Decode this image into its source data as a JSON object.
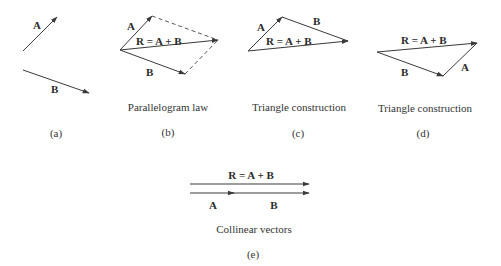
{
  "figure": {
    "colors": {
      "vector": "#3a3a3a",
      "dashed": "#555555",
      "text": "#2b2b2b",
      "background": "#ffffff"
    },
    "panels": [
      {
        "id": "a",
        "sublabel": "(a)",
        "caption": "",
        "vectors": [
          {
            "name": "A",
            "label": "A"
          },
          {
            "name": "B",
            "label": "B"
          }
        ]
      },
      {
        "id": "b",
        "sublabel": "(b)",
        "caption": "Parallelogram law",
        "vectors": [
          {
            "name": "A",
            "label": "A"
          },
          {
            "name": "B",
            "label": "B"
          },
          {
            "name": "R",
            "label": "R = A + B"
          }
        ]
      },
      {
        "id": "c",
        "sublabel": "(c)",
        "caption": "Triangle construction",
        "vectors": [
          {
            "name": "A",
            "label": "A"
          },
          {
            "name": "B",
            "label": "B"
          },
          {
            "name": "R",
            "label": "R = A + B"
          }
        ]
      },
      {
        "id": "d",
        "sublabel": "(d)",
        "caption": "Triangle construction",
        "vectors": [
          {
            "name": "B",
            "label": "B"
          },
          {
            "name": "A",
            "label": "A"
          },
          {
            "name": "R",
            "label": "R = A + B"
          }
        ]
      },
      {
        "id": "e",
        "sublabel": "(e)",
        "caption": "Collinear vectors",
        "vectors": [
          {
            "name": "R",
            "label": "R = A + B"
          },
          {
            "name": "A",
            "label": "A"
          },
          {
            "name": "B",
            "label": "B"
          }
        ]
      }
    ]
  }
}
